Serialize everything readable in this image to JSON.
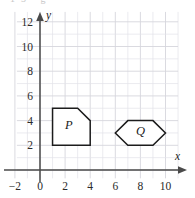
{
  "chart_data": {
    "type": "scatter",
    "title": "",
    "xlabel": "x",
    "ylabel": "y",
    "xlim": [
      -2,
      11
    ],
    "ylim": [
      -1,
      12.8
    ],
    "grid": true,
    "grid_step": 1,
    "legend": "none",
    "x_ticks": [
      -2,
      0,
      2,
      4,
      6,
      8,
      10
    ],
    "x_tick_labels": [
      "-2",
      "0",
      "2",
      "4",
      "6",
      "8",
      "10"
    ],
    "y_ticks": [
      2,
      4,
      6,
      8,
      10,
      12
    ],
    "y_tick_labels": [
      "2",
      "4",
      "6",
      "8",
      "10",
      "12"
    ],
    "shapes": [
      {
        "label": "P",
        "type": "pentagon",
        "vertices": [
          [
            1,
            2
          ],
          [
            1,
            5
          ],
          [
            3,
            5
          ],
          [
            4,
            4
          ],
          [
            4,
            2
          ]
        ],
        "label_position": [
          2.3,
          3.3
        ],
        "fill": "#ffffff",
        "stroke": "#1c1c1c"
      },
      {
        "label": "Q",
        "type": "hexagon",
        "vertices": [
          [
            6,
            3
          ],
          [
            7,
            4
          ],
          [
            9,
            4
          ],
          [
            10,
            3
          ],
          [
            9,
            2
          ],
          [
            7,
            2
          ]
        ],
        "label_position": [
          8,
          2.85
        ],
        "fill": "#ffffff",
        "stroke": "#1c1c1c"
      }
    ]
  },
  "axes": {
    "x_axis_name": "x",
    "y_axis_name": "y",
    "x_arrow_icon": "arrow-right-icon",
    "y_arrow_icon": "arrow-up-icon"
  },
  "clipped_header_text": "13        g"
}
